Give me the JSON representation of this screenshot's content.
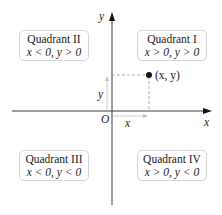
{
  "diagram": {
    "axes": {
      "x_label": "x",
      "y_label": "y",
      "origin_label": "O"
    },
    "point": {
      "label": "(x, y)",
      "x_component_label": "x",
      "y_component_label": "y"
    },
    "quadrants": [
      {
        "id": "II",
        "title": "Quadrant II",
        "condition": "x < 0, y > 0"
      },
      {
        "id": "I",
        "title": "Quadrant I",
        "condition": "x > 0, y > 0"
      },
      {
        "id": "III",
        "title": "Quadrant III",
        "condition": "x < 0, y < 0"
      },
      {
        "id": "IV",
        "title": "Quadrant IV",
        "condition": "x > 0, y < 0"
      }
    ],
    "colors": {
      "axis": "#3a3a3a",
      "guide_dash": "#9a9a9a",
      "dimension_arrow": "#b8b8b8",
      "box_border": "#d6d6d6",
      "point": "#111111"
    }
  }
}
